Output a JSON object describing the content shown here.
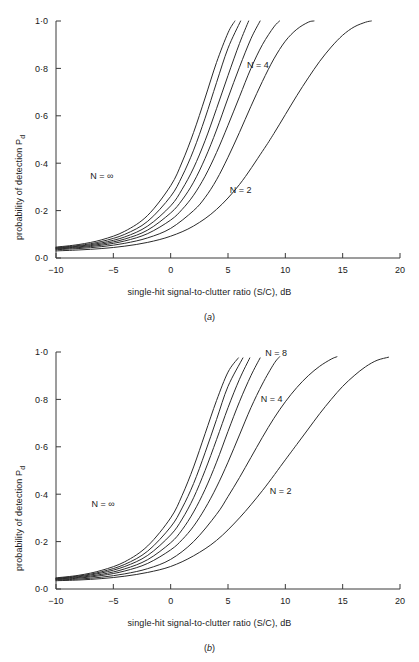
{
  "figure": {
    "width": 419,
    "height": 662,
    "background": "#ffffff",
    "line_color": "#2b2b2b",
    "axis_color": "#3a3a3a"
  },
  "panels": [
    {
      "caption_open": "(",
      "caption": "a",
      "caption_close": ")",
      "ylabel_main": "probability of detection P",
      "ylabel_sub": "d",
      "xlabel": "single-hit signal-to-clutter ratio (S/C), dB",
      "xticks": [
        "−10",
        "−5",
        "0",
        "5",
        "10",
        "15",
        "20"
      ],
      "yticks": [
        "0·0",
        "0·2",
        "0·4",
        "0·6",
        "0·8",
        "1·0"
      ],
      "annotations": [
        {
          "text": "N = 4",
          "x": 7.6,
          "y": 0.8
        },
        {
          "text": "N = 2",
          "x": 6.1,
          "y": 0.275
        },
        {
          "text": "N = ∞",
          "x": -6.0,
          "y": 0.335
        }
      ]
    },
    {
      "caption_open": "(",
      "caption": "b",
      "caption_close": ")",
      "ylabel_main": "probability of detection P",
      "ylabel_sub": "d",
      "xlabel": "single-hit signal-to-clutter ratio (S/C), dB",
      "xticks": [
        "−10",
        "−5",
        "0",
        "5",
        "10",
        "15",
        "20"
      ],
      "yticks": [
        "0·0",
        "0·2",
        "0·4",
        "0·6",
        "0·8",
        "1·0"
      ],
      "annotations": [
        {
          "text": "N = 8",
          "x": 9.2,
          "y": 0.985
        },
        {
          "text": "N = 4",
          "x": 8.8,
          "y": 0.79
        },
        {
          "text": "N = 2",
          "x": 9.6,
          "y": 0.4
        },
        {
          "text": "N = ∞",
          "x": -5.9,
          "y": 0.345
        }
      ]
    }
  ],
  "chart_data": [
    {
      "type": "line",
      "panel": "a",
      "title": "",
      "xlabel": "single-hit signal-to-clutter ratio (S/C), dB",
      "ylabel": "probability of detection Pd",
      "xlim": [
        -10,
        20
      ],
      "ylim": [
        0.0,
        1.0
      ],
      "xticks": [
        -10,
        -5,
        0,
        5,
        10,
        15,
        20
      ],
      "yticks": [
        0.0,
        0.2,
        0.4,
        0.6,
        0.8,
        1.0
      ],
      "grid": false,
      "legend": "inline-annotations",
      "baseline_pd": 0.04,
      "series": [
        {
          "name": "N = 2",
          "x": [
            -10,
            -8,
            -6,
            -4,
            -2,
            0,
            2,
            4,
            6,
            8,
            9,
            10,
            11,
            12,
            13,
            14,
            15,
            16,
            17,
            17.5
          ],
          "values": [
            0.03,
            0.034,
            0.04,
            0.05,
            0.066,
            0.092,
            0.135,
            0.205,
            0.31,
            0.45,
            0.525,
            0.605,
            0.685,
            0.76,
            0.83,
            0.89,
            0.94,
            0.975,
            0.995,
            1.0
          ]
        },
        {
          "name": "N = 4",
          "x": [
            -10,
            -8,
            -6,
            -4,
            -2,
            0,
            2,
            3,
            4,
            5,
            6,
            7,
            8,
            9,
            10,
            11,
            12,
            12.5
          ],
          "values": [
            0.035,
            0.04,
            0.048,
            0.062,
            0.085,
            0.125,
            0.2,
            0.255,
            0.33,
            0.425,
            0.53,
            0.64,
            0.745,
            0.84,
            0.915,
            0.965,
            0.995,
            1.0
          ]
        },
        {
          "name": "N = 6",
          "x": [
            -10,
            -8,
            -6,
            -4,
            -2,
            0,
            1,
            2,
            3,
            4,
            5,
            6,
            7,
            8,
            9,
            9.5
          ],
          "values": [
            0.038,
            0.044,
            0.054,
            0.072,
            0.103,
            0.16,
            0.205,
            0.265,
            0.345,
            0.445,
            0.56,
            0.68,
            0.8,
            0.9,
            0.975,
            1.0
          ]
        },
        {
          "name": "N = 8",
          "x": [
            -10,
            -8,
            -6,
            -4,
            -2,
            0,
            1,
            2,
            3,
            4,
            5,
            6,
            7,
            7.8
          ],
          "values": [
            0.04,
            0.047,
            0.059,
            0.08,
            0.118,
            0.19,
            0.245,
            0.32,
            0.42,
            0.54,
            0.675,
            0.805,
            0.925,
            1.0
          ]
        },
        {
          "name": "N = 12",
          "x": [
            -10,
            -8,
            -6,
            -4,
            -2,
            0,
            1,
            2,
            3,
            4,
            5,
            6,
            6.8
          ],
          "values": [
            0.042,
            0.05,
            0.064,
            0.089,
            0.135,
            0.22,
            0.29,
            0.38,
            0.495,
            0.63,
            0.77,
            0.905,
            1.0
          ]
        },
        {
          "name": "N = 24",
          "x": [
            -10,
            -8,
            -6,
            -4,
            -2,
            0,
            1,
            2,
            3,
            4,
            5,
            6.1
          ],
          "values": [
            0.044,
            0.053,
            0.07,
            0.1,
            0.155,
            0.26,
            0.345,
            0.455,
            0.59,
            0.74,
            0.885,
            1.0
          ]
        },
        {
          "name": "N = ∞",
          "x": [
            -10,
            -8,
            -6,
            -4,
            -2,
            0,
            1,
            2,
            3,
            4,
            5,
            5.6
          ],
          "values": [
            0.046,
            0.057,
            0.077,
            0.113,
            0.18,
            0.305,
            0.405,
            0.53,
            0.675,
            0.825,
            0.95,
            1.0
          ]
        }
      ]
    },
    {
      "type": "line",
      "panel": "b",
      "title": "",
      "xlabel": "single-hit signal-to-clutter ratio (S/C), dB",
      "ylabel": "probability of detection Pd",
      "xlim": [
        -10,
        20
      ],
      "ylim": [
        0.0,
        1.0
      ],
      "xticks": [
        -10,
        -5,
        0,
        5,
        10,
        15,
        20
      ],
      "yticks": [
        0.0,
        0.2,
        0.4,
        0.6,
        0.8,
        1.0
      ],
      "grid": false,
      "legend": "inline-annotations",
      "baseline_pd": 0.04,
      "series": [
        {
          "name": "N = 2",
          "x": [
            -10,
            -8,
            -6,
            -4,
            -2,
            0,
            2,
            4,
            6,
            8,
            10,
            11,
            12,
            13,
            14,
            15,
            16,
            17,
            18,
            19
          ],
          "values": [
            0.035,
            0.038,
            0.044,
            0.054,
            0.07,
            0.095,
            0.14,
            0.205,
            0.3,
            0.415,
            0.545,
            0.61,
            0.675,
            0.74,
            0.8,
            0.855,
            0.9,
            0.938,
            0.965,
            0.978
          ]
        },
        {
          "name": "N = 4",
          "x": [
            -10,
            -8,
            -6,
            -4,
            -2,
            0,
            2,
            4,
            5,
            6,
            7,
            8,
            9,
            10,
            11,
            12,
            13,
            14,
            14.5
          ],
          "values": [
            0.038,
            0.042,
            0.05,
            0.064,
            0.086,
            0.125,
            0.2,
            0.315,
            0.39,
            0.47,
            0.555,
            0.64,
            0.72,
            0.79,
            0.85,
            0.9,
            0.94,
            0.97,
            0.98
          ]
        },
        {
          "name": "N = 8",
          "x": [
            -10,
            -8,
            -6,
            -4,
            -2,
            0,
            1,
            2,
            3,
            4,
            5,
            6,
            7,
            8,
            9,
            9.5
          ],
          "values": [
            0.04,
            0.046,
            0.057,
            0.076,
            0.108,
            0.165,
            0.208,
            0.265,
            0.34,
            0.43,
            0.535,
            0.65,
            0.765,
            0.865,
            0.95,
            0.98
          ]
        },
        {
          "name": "N = 12",
          "x": [
            -10,
            -8,
            -6,
            -4,
            -2,
            0,
            1,
            2,
            3,
            4,
            5,
            6,
            7,
            7.8
          ],
          "values": [
            0.042,
            0.049,
            0.062,
            0.085,
            0.124,
            0.195,
            0.25,
            0.325,
            0.42,
            0.535,
            0.665,
            0.79,
            0.9,
            0.975
          ]
        },
        {
          "name": "N = 24",
          "x": [
            -10,
            -8,
            -6,
            -4,
            -2,
            0,
            1,
            2,
            3,
            4,
            5,
            6,
            6.9
          ],
          "values": [
            0.044,
            0.052,
            0.068,
            0.095,
            0.142,
            0.228,
            0.295,
            0.385,
            0.5,
            0.63,
            0.765,
            0.885,
            0.975
          ]
        },
        {
          "name": "N = 48",
          "x": [
            -10,
            -8,
            -6,
            -4,
            -2,
            0,
            1,
            2,
            3,
            4,
            5,
            6.3
          ],
          "values": [
            0.045,
            0.055,
            0.073,
            0.104,
            0.16,
            0.262,
            0.342,
            0.445,
            0.575,
            0.715,
            0.855,
            0.975
          ]
        },
        {
          "name": "N = ∞",
          "x": [
            -10,
            -8,
            -6,
            -4,
            -2,
            0,
            1,
            2,
            3,
            4,
            5,
            5.9
          ],
          "values": [
            0.047,
            0.058,
            0.079,
            0.115,
            0.182,
            0.3,
            0.395,
            0.515,
            0.655,
            0.795,
            0.915,
            0.975
          ]
        }
      ]
    }
  ]
}
